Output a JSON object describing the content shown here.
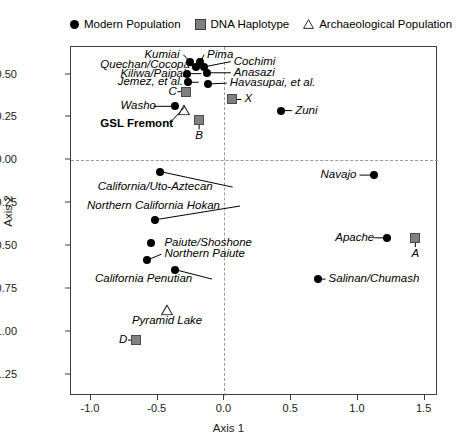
{
  "legend": {
    "items": [
      {
        "label": "Modern Population",
        "marker": "circle-icon"
      },
      {
        "label": "DNA Haplotype",
        "marker": "square-icon"
      },
      {
        "label": "Archaeological Population",
        "marker": "triangle-icon"
      }
    ]
  },
  "chart_data": {
    "type": "scatter",
    "title": "",
    "xlabel": "Axis 1",
    "ylabel": "Axis 2",
    "xlim": [
      -1.15,
      1.6
    ],
    "ylim": [
      -1.37,
      0.66
    ],
    "xticks": [
      "-1.0",
      "-0.5",
      "0.0",
      "0.5",
      "1.0",
      "1.5"
    ],
    "xtick_values": [
      -1.0,
      -0.5,
      0.0,
      0.5,
      1.0,
      1.5
    ],
    "yticks": [
      "0.50",
      "0.25",
      "0.00",
      "-0.25",
      "-0.50",
      "-0.75",
      "-1.00",
      "-1.25"
    ],
    "ytick_values": [
      0.5,
      0.25,
      0.0,
      -0.25,
      -0.5,
      -0.75,
      -1.0,
      -1.25
    ],
    "grid": false,
    "reference_lines": {
      "x": 0.0,
      "y": 0.0,
      "style": "dashed"
    },
    "legend_position": "above-plot",
    "series": [
      {
        "name": "Modern Population",
        "marker": "circle",
        "color": "#000000",
        "points": [
          {
            "label": "Kumiai",
            "x": -0.26,
            "y": 0.575,
            "label_x": -0.6,
            "label_y": 0.615,
            "align": "left",
            "leader": true
          },
          {
            "label": "Pima",
            "x": -0.18,
            "y": 0.575,
            "label_x": -0.13,
            "label_y": 0.615,
            "align": "left",
            "leader": true
          },
          {
            "label": "Quechan/Cocopa",
            "x": -0.21,
            "y": 0.545,
            "label_x": -0.93,
            "label_y": 0.555,
            "align": "left",
            "leader": true
          },
          {
            "label": "Cochimi",
            "x": -0.15,
            "y": 0.545,
            "label_x": 0.07,
            "label_y": 0.575,
            "align": "left",
            "leader": true
          },
          {
            "label": "Kiliwa/Paipai",
            "x": -0.28,
            "y": 0.505,
            "label_x": -0.78,
            "label_y": 0.505,
            "align": "left",
            "leader": true
          },
          {
            "label": "Anasazi",
            "x": -0.13,
            "y": 0.51,
            "label_x": 0.07,
            "label_y": 0.51,
            "align": "left",
            "leader": true
          },
          {
            "label": "Jemez, et al.",
            "x": -0.27,
            "y": 0.455,
            "label_x": -0.8,
            "label_y": 0.455,
            "align": "left",
            "leader": true
          },
          {
            "label": "Havasupai, et al.",
            "x": -0.12,
            "y": 0.445,
            "label_x": 0.04,
            "label_y": 0.45,
            "align": "left",
            "leader": true
          },
          {
            "label": "Washo",
            "x": -0.37,
            "y": 0.315,
            "label_x": -0.78,
            "label_y": 0.315,
            "align": "left",
            "leader": true
          },
          {
            "label": "Zuni",
            "x": 0.42,
            "y": 0.29,
            "label_x": 0.53,
            "label_y": 0.29,
            "align": "left",
            "leader": true
          },
          {
            "label": "California/Uto-Aztecan",
            "x": -0.48,
            "y": -0.065,
            "label_x": -0.95,
            "label_y": -0.155,
            "align": "left",
            "leader": true
          },
          {
            "label": "Navajo",
            "x": 1.12,
            "y": -0.085,
            "label_x": 0.72,
            "label_y": -0.085,
            "align": "left",
            "leader": true
          },
          {
            "label": "Northern California Hokan",
            "x": -0.52,
            "y": -0.345,
            "label_x": -1.03,
            "label_y": -0.265,
            "align": "left",
            "leader": true
          },
          {
            "label": "Apache",
            "x": 1.22,
            "y": -0.45,
            "label_x": 0.83,
            "label_y": -0.45,
            "align": "left",
            "leader": true
          },
          {
            "label": "Paiute/Shoshone",
            "x": -0.55,
            "y": -0.48,
            "label_x": -0.45,
            "label_y": -0.48,
            "align": "left",
            "leader": false
          },
          {
            "label": "Northern Paiute",
            "x": -0.58,
            "y": -0.58,
            "label_x": -0.45,
            "label_y": -0.545,
            "align": "left",
            "leader": true
          },
          {
            "label": "California Penutian",
            "x": -0.37,
            "y": -0.635,
            "label_x": -0.97,
            "label_y": -0.69,
            "align": "left",
            "leader": true
          },
          {
            "label": "Salinan/Chumash",
            "x": 0.7,
            "y": -0.69,
            "label_x": 0.78,
            "label_y": -0.69,
            "align": "left",
            "leader": true
          }
        ]
      },
      {
        "name": "DNA Haplotype",
        "marker": "square",
        "color": "#808080",
        "points": [
          {
            "label": "C",
            "x": -0.29,
            "y": 0.4,
            "label_x": -0.42,
            "label_y": 0.4,
            "align": "left",
            "leader": true
          },
          {
            "label": "X",
            "x": 0.06,
            "y": 0.355,
            "label_x": 0.15,
            "label_y": 0.355,
            "align": "left",
            "leader": true
          },
          {
            "label": "B",
            "x": -0.19,
            "y": 0.235,
            "label_x": -0.19,
            "label_y": 0.14,
            "align": "center",
            "leader": true
          },
          {
            "label": "A",
            "x": 1.43,
            "y": -0.45,
            "label_x": 1.43,
            "label_y": -0.545,
            "align": "center",
            "leader": true
          },
          {
            "label": "D",
            "x": -0.66,
            "y": -1.045,
            "label_x": -0.79,
            "label_y": -1.045,
            "align": "left",
            "leader": true
          }
        ]
      },
      {
        "name": "Archaeological Population",
        "marker": "triangle",
        "color": "#000000",
        "points": [
          {
            "label": "GSL Fremont",
            "x": -0.3,
            "y": 0.31,
            "label_x": -0.93,
            "label_y": 0.215,
            "align": "left",
            "leader": true,
            "bold": true
          },
          {
            "label": "Pyramid Lake",
            "x": -0.43,
            "y": -0.855,
            "label_x": -0.43,
            "label_y": -0.935,
            "align": "center",
            "leader": false,
            "bold": false
          }
        ]
      }
    ]
  }
}
